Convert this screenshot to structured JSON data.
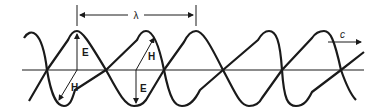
{
  "diagram": {
    "labels": {
      "wavelength": "λ",
      "velocity": "c",
      "electric_field_1": "E",
      "magnetic_field_1": "H",
      "electric_field_2": "E",
      "magnetic_field_2": "H"
    },
    "colors": {
      "stroke": "#1a1a1a",
      "background": "#ffffff"
    }
  }
}
